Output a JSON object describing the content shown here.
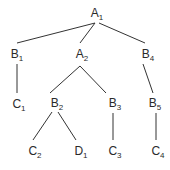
{
  "diagram": {
    "type": "tree",
    "nodes": [
      {
        "id": "A1",
        "letter": "A",
        "sub": "1"
      },
      {
        "id": "B1",
        "letter": "B",
        "sub": "1"
      },
      {
        "id": "A2",
        "letter": "A",
        "sub": "2"
      },
      {
        "id": "B4",
        "letter": "B",
        "sub": "4"
      },
      {
        "id": "C1",
        "letter": "C",
        "sub": "1"
      },
      {
        "id": "B2",
        "letter": "B",
        "sub": "2"
      },
      {
        "id": "B3",
        "letter": "B",
        "sub": "3"
      },
      {
        "id": "B5",
        "letter": "B",
        "sub": "5"
      },
      {
        "id": "C2",
        "letter": "C",
        "sub": "2"
      },
      {
        "id": "D1",
        "letter": "D",
        "sub": "1"
      },
      {
        "id": "C3",
        "letter": "C",
        "sub": "3"
      },
      {
        "id": "C4",
        "letter": "C",
        "sub": "4"
      }
    ],
    "edges": [
      [
        "A1",
        "B1"
      ],
      [
        "A1",
        "A2"
      ],
      [
        "A1",
        "B4"
      ],
      [
        "B1",
        "C1"
      ],
      [
        "A2",
        "B2"
      ],
      [
        "A2",
        "B3"
      ],
      [
        "B4",
        "B5"
      ],
      [
        "B2",
        "C2"
      ],
      [
        "B2",
        "D1"
      ],
      [
        "B3",
        "C3"
      ],
      [
        "B5",
        "C4"
      ]
    ]
  }
}
